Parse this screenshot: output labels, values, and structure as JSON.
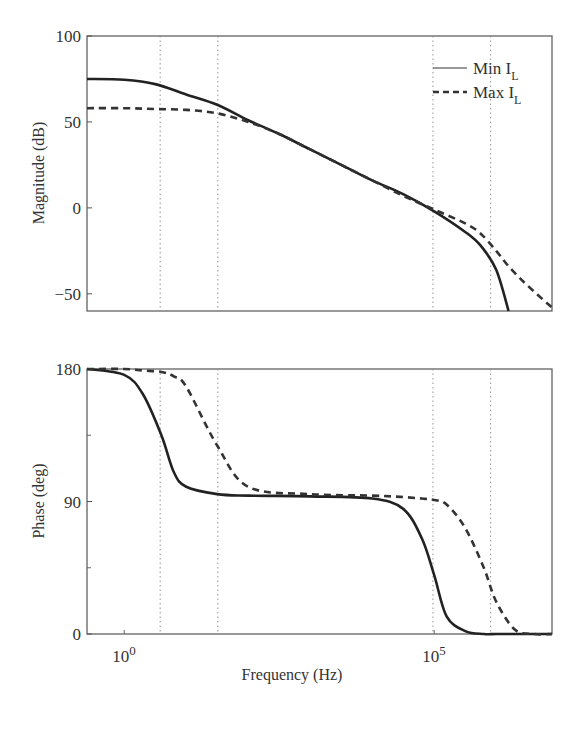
{
  "chart_data": [
    {
      "type": "line",
      "panel": "magnitude",
      "title": "",
      "xlabel": "",
      "ylabel": "Magnitude (dB)",
      "xscale": "log",
      "xlim_log10": [
        -0.6,
        6.9
      ],
      "ylim": [
        -60,
        100
      ],
      "yticks": [
        100,
        50,
        0,
        -50
      ],
      "grid": false,
      "reference_lines_log10_x": [
        0.58,
        1.51,
        4.98,
        5.91
      ],
      "legend": {
        "position": "upper right",
        "entries": [
          {
            "label": "Min I",
            "sub": "L",
            "style": "solid"
          },
          {
            "label": "Max I",
            "sub": "L",
            "style": "dashed"
          }
        ]
      },
      "x_log10": [
        -0.6,
        0.0,
        0.5,
        1.0,
        1.5,
        2.0,
        2.5,
        3.0,
        3.5,
        4.0,
        4.5,
        5.0,
        5.5,
        5.75,
        6.0,
        6.2,
        6.5,
        6.9
      ],
      "series": [
        {
          "name": "Min I_L",
          "style": "solid",
          "values": [
            75,
            74.5,
            72,
            66,
            60,
            51,
            43,
            34,
            25,
            16,
            8,
            -2,
            -14,
            -22,
            -36,
            -62,
            null,
            null
          ]
        },
        {
          "name": "Max I_L",
          "style": "dashed",
          "values": [
            58,
            58,
            57.5,
            57,
            55,
            50,
            43,
            34,
            25,
            16,
            7,
            -1,
            -9,
            -15,
            -25,
            -34,
            -45,
            -58
          ]
        }
      ]
    },
    {
      "type": "line",
      "panel": "phase",
      "title": "",
      "xlabel": "Frequency (Hz)",
      "ylabel": "Phase (deg)",
      "xscale": "log",
      "xlim_log10": [
        -0.6,
        6.9
      ],
      "ylim": [
        0,
        180
      ],
      "yticks": [
        180,
        90,
        0
      ],
      "xtick_labels": [
        {
          "base": "10",
          "exp": "0",
          "log10": 0
        },
        {
          "base": "10",
          "exp": "5",
          "log10": 5
        }
      ],
      "grid": false,
      "reference_lines_log10_x": [
        0.58,
        1.51,
        4.98,
        5.91
      ],
      "x_log10": [
        -0.6,
        0.0,
        0.3,
        0.6,
        0.8,
        1.0,
        1.5,
        2.0,
        3.0,
        4.0,
        4.5,
        4.8,
        5.0,
        5.2,
        5.5,
        5.8,
        6.0,
        6.3,
        6.6,
        6.9
      ],
      "series": [
        {
          "name": "Min I_L",
          "style": "solid",
          "values": [
            180,
            176,
            163,
            135,
            110,
            100,
            95,
            94,
            93.5,
            92,
            85,
            65,
            40,
            12,
            2,
            0,
            0,
            0,
            0,
            0
          ]
        },
        {
          "name": "Max I_L",
          "style": "dashed",
          "values": [
            180,
            180,
            179,
            178,
            175,
            168,
            128,
            100,
            95,
            94,
            93,
            92,
            91,
            88,
            72,
            45,
            22,
            3,
            0,
            0
          ]
        }
      ]
    }
  ]
}
